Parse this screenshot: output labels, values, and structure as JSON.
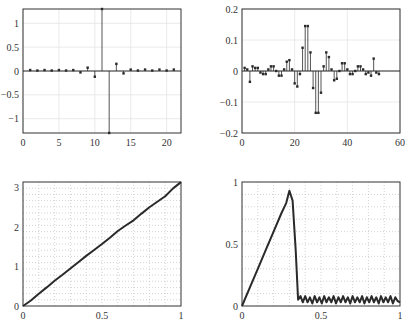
{
  "chart_data": [
    {
      "id": "tl",
      "type": "stem",
      "title": "",
      "xlabel": "",
      "ylabel": "",
      "xlim": [
        0,
        22
      ],
      "ylim": [
        -1.3,
        1.3
      ],
      "xticks": [
        0,
        5,
        10,
        15,
        20
      ],
      "yticks": [
        -1,
        -0.5,
        0,
        0.5,
        1
      ],
      "ytick_labels": [
        "−1",
        "−0.5",
        "0",
        "0.5",
        "1"
      ],
      "grid": true,
      "x": [
        1,
        2,
        3,
        4,
        5,
        6,
        7,
        8,
        9,
        10,
        11,
        12,
        13,
        14,
        15,
        16,
        17,
        18,
        19,
        20,
        21
      ],
      "values": [
        0.02,
        0.01,
        0.02,
        0.01,
        0.02,
        0.01,
        0.02,
        -0.03,
        0.07,
        -0.12,
        1.3,
        -1.3,
        0.15,
        -0.05,
        0.03,
        0.01,
        0.03,
        0.01,
        0.03,
        0.01,
        0.03
      ]
    },
    {
      "id": "tr",
      "type": "stem",
      "title": "",
      "xlabel": "",
      "ylabel": "",
      "xlim": [
        0,
        60
      ],
      "ylim": [
        -0.2,
        0.2
      ],
      "xticks": [
        0,
        20,
        40,
        60
      ],
      "yticks": [
        -0.2,
        -0.1,
        0,
        0.1,
        0.2
      ],
      "ytick_labels": [
        "−0.2",
        "−0.1",
        "0",
        "0.1",
        "0.2"
      ],
      "grid": true,
      "x": [
        1,
        2,
        3,
        4,
        5,
        6,
        7,
        8,
        9,
        10,
        11,
        12,
        13,
        14,
        15,
        16,
        17,
        18,
        19,
        20,
        21,
        22,
        23,
        24,
        25,
        26,
        27,
        28,
        29,
        30,
        31,
        32,
        33,
        34,
        35,
        36,
        37,
        38,
        39,
        40,
        41,
        42,
        43,
        44,
        45,
        46,
        47,
        48,
        49,
        50,
        51,
        52
      ],
      "values": [
        0.01,
        0.005,
        -0.035,
        0.015,
        0.01,
        0.01,
        -0.005,
        -0.01,
        -0.01,
        0.005,
        0.015,
        0.015,
        0.0,
        -0.015,
        -0.015,
        0.005,
        0.03,
        0.035,
        0.005,
        -0.04,
        -0.05,
        -0.01,
        0.075,
        0.145,
        0.145,
        0.06,
        -0.055,
        -0.135,
        -0.135,
        -0.07,
        0.015,
        0.06,
        0.045,
        0.005,
        -0.03,
        -0.025,
        0.0,
        0.025,
        0.025,
        0.005,
        -0.01,
        -0.01,
        0.0,
        0.015,
        0.015,
        0.005,
        -0.01,
        -0.005,
        -0.015,
        0.04,
        -0.005,
        -0.01
      ]
    },
    {
      "id": "bl",
      "type": "line",
      "title": "",
      "xlabel": "",
      "ylabel": "",
      "xlim": [
        0,
        1
      ],
      "ylim": [
        0,
        3.14159
      ],
      "xticks": [
        0,
        0.5,
        1
      ],
      "xtick_labels": [
        "0",
        "0.5",
        "1"
      ],
      "yticks": [
        0,
        1,
        2,
        3
      ],
      "grid": true,
      "grid_style": "dotted-minor",
      "x": [
        0,
        0.05,
        0.1,
        0.15,
        0.2,
        0.25,
        0.3,
        0.35,
        0.4,
        0.45,
        0.5,
        0.55,
        0.6,
        0.65,
        0.7,
        0.75,
        0.8,
        0.85,
        0.9,
        0.95,
        1.0
      ],
      "values": [
        0,
        0.14,
        0.31,
        0.47,
        0.64,
        0.79,
        0.95,
        1.11,
        1.27,
        1.42,
        1.57,
        1.73,
        1.9,
        2.04,
        2.17,
        2.34,
        2.5,
        2.64,
        2.78,
        2.98,
        3.14
      ]
    },
    {
      "id": "br",
      "type": "line",
      "title": "",
      "xlabel": "",
      "ylabel": "",
      "xlim": [
        0,
        1
      ],
      "ylim": [
        0,
        1
      ],
      "xticks": [
        0,
        0.5,
        1
      ],
      "xtick_labels": [
        "0",
        "0.5",
        "1"
      ],
      "yticks": [
        0,
        0.5,
        1
      ],
      "ytick_labels": [
        "0",
        "0.5",
        "1"
      ],
      "grid": true,
      "grid_style": "dotted-minor",
      "x": [
        0,
        0.05,
        0.1,
        0.15,
        0.2,
        0.25,
        0.28,
        0.3,
        0.32,
        0.34,
        0.355,
        0.37,
        0.385,
        0.4,
        0.415,
        0.43,
        0.445,
        0.46,
        0.475,
        0.49,
        0.505,
        0.52,
        0.535,
        0.55,
        0.565,
        0.58,
        0.595,
        0.61,
        0.625,
        0.64,
        0.655,
        0.67,
        0.685,
        0.7,
        0.715,
        0.73,
        0.745,
        0.76,
        0.775,
        0.79,
        0.805,
        0.82,
        0.835,
        0.85,
        0.865,
        0.88,
        0.895,
        0.91,
        0.925,
        0.94,
        0.955,
        0.97,
        0.985,
        1.0
      ],
      "values": [
        0,
        0.15,
        0.3,
        0.45,
        0.6,
        0.75,
        0.83,
        0.93,
        0.85,
        0.45,
        0.05,
        0.08,
        0.03,
        0.08,
        0.03,
        0.07,
        0.02,
        0.08,
        0.03,
        0.07,
        0.02,
        0.08,
        0.03,
        0.07,
        0.03,
        0.08,
        0.02,
        0.07,
        0.03,
        0.08,
        0.03,
        0.07,
        0.02,
        0.08,
        0.03,
        0.07,
        0.03,
        0.08,
        0.02,
        0.07,
        0.03,
        0.08,
        0.03,
        0.07,
        0.02,
        0.08,
        0.03,
        0.07,
        0.03,
        0.08,
        0.02,
        0.07,
        0.04,
        0.03
      ]
    }
  ],
  "layout": {
    "panels": {
      "tl": {
        "x0": 23,
        "x1": 181,
        "y0": 9,
        "y1": 133
      },
      "tr": {
        "x0": 242,
        "x1": 400,
        "y0": 9,
        "y1": 133
      },
      "bl": {
        "x0": 23,
        "x1": 181,
        "y0": 182,
        "y1": 306
      },
      "br": {
        "x0": 242,
        "x1": 400,
        "y0": 182,
        "y1": 306
      }
    },
    "colors": {
      "axis": "#333333",
      "data": "#2a2a2a",
      "grid": "#c8c8c8"
    }
  }
}
